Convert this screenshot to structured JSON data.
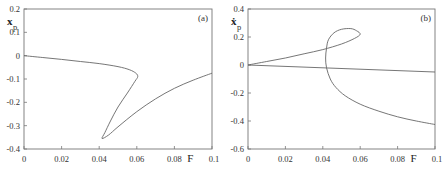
{
  "chart_data": [
    {
      "type": "line",
      "panel_label": "(a)",
      "xlabel": "F",
      "ylabel": "x_p",
      "ylabel_display": {
        "main": "x",
        "sub": "p"
      },
      "xlim": [
        0,
        0.1
      ],
      "ylim": [
        -0.4,
        0.2
      ],
      "x_ticks": [
        "0",
        "0.02",
        "0.04",
        "0.06",
        "0.08",
        "0.1"
      ],
      "y_ticks": [
        "0.2",
        "0.1",
        "0",
        "-0.1",
        "-0.2",
        "-0.3",
        "-0.4"
      ],
      "grid": false,
      "series": [
        {
          "name": "x_p branch",
          "points": [
            [
              0.0,
              0.0
            ],
            [
              0.01,
              -0.008
            ],
            [
              0.02,
              -0.016
            ],
            [
              0.03,
              -0.025
            ],
            [
              0.04,
              -0.034
            ],
            [
              0.05,
              -0.047
            ],
            [
              0.056,
              -0.06
            ],
            [
              0.0595,
              -0.075
            ],
            [
              0.0605,
              -0.09
            ],
            [
              0.059,
              -0.11
            ],
            [
              0.055,
              -0.16
            ],
            [
              0.05,
              -0.22
            ],
            [
              0.046,
              -0.28
            ],
            [
              0.043,
              -0.33
            ],
            [
              0.0415,
              -0.355
            ],
            [
              0.045,
              -0.34
            ],
            [
              0.05,
              -0.305
            ],
            [
              0.06,
              -0.24
            ],
            [
              0.07,
              -0.185
            ],
            [
              0.08,
              -0.14
            ],
            [
              0.09,
              -0.105
            ],
            [
              0.1,
              -0.075
            ]
          ]
        }
      ]
    },
    {
      "type": "line",
      "panel_label": "(b)",
      "xlabel": "F",
      "ylabel": "ẋ_p",
      "ylabel_display": {
        "main": "ẋ",
        "sub": "p"
      },
      "xlim": [
        0,
        0.1
      ],
      "ylim": [
        -0.6,
        0.4
      ],
      "x_ticks": [
        "0",
        "0.02",
        "0.04",
        "0.06",
        "0.08",
        "0.1"
      ],
      "y_ticks": [
        "0.4",
        "0.2",
        "0",
        "-0.2",
        "-0.4",
        "-0.6"
      ],
      "grid": false,
      "series": [
        {
          "name": "loop branch",
          "points": [
            [
              0.0,
              0.0
            ],
            [
              0.01,
              0.025
            ],
            [
              0.02,
              0.05
            ],
            [
              0.03,
              0.08
            ],
            [
              0.04,
              0.11
            ],
            [
              0.05,
              0.15
            ],
            [
              0.057,
              0.19
            ],
            [
              0.06,
              0.22
            ],
            [
              0.058,
              0.245
            ],
            [
              0.055,
              0.26
            ],
            [
              0.05,
              0.255
            ],
            [
              0.046,
              0.23
            ],
            [
              0.043,
              0.18
            ],
            [
              0.042,
              0.12
            ],
            [
              0.0415,
              0.05
            ],
            [
              0.042,
              -0.02
            ],
            [
              0.044,
              -0.1
            ],
            [
              0.047,
              -0.16
            ],
            [
              0.052,
              -0.22
            ],
            [
              0.06,
              -0.28
            ],
            [
              0.07,
              -0.33
            ],
            [
              0.08,
              -0.37
            ],
            [
              0.09,
              -0.4
            ],
            [
              0.1,
              -0.425
            ]
          ]
        },
        {
          "name": "straight branch",
          "points": [
            [
              0.0,
              0.0
            ],
            [
              0.1,
              -0.05
            ]
          ]
        }
      ]
    }
  ]
}
